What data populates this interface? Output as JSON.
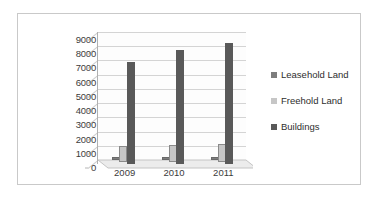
{
  "chart_data": {
    "type": "bar",
    "title": "",
    "subtitle": "",
    "xlabel": "",
    "ylabel": "",
    "categories": [
      "2009",
      "2010",
      "2011"
    ],
    "series": [
      {
        "name": "Leasehold Land",
        "values": [
          200,
          200,
          200
        ],
        "color": "#7d7d7d"
      },
      {
        "name": "Freehold Land",
        "values": [
          1100,
          1200,
          1250
        ],
        "color": "#c6c6c6"
      },
      {
        "name": "Buildings",
        "values": [
          7200,
          8050,
          8500
        ],
        "color": "#595959"
      }
    ],
    "ylim": [
      0,
      9000
    ],
    "yticks": [
      0,
      1000,
      2000,
      3000,
      4000,
      5000,
      6000,
      7000,
      8000,
      9000
    ],
    "ytick_labels": [
      "0",
      "1000",
      "2000",
      "3000",
      "4000",
      "5000",
      "6000",
      "7000",
      "8000",
      "9000"
    ],
    "grid": true,
    "legend_position": "right",
    "style": "3d-clustered-column"
  },
  "legend": {
    "items": [
      {
        "label": "Leasehold Land",
        "color": "#7d7d7d"
      },
      {
        "label": "Freehold Land",
        "color": "#c6c6c6"
      },
      {
        "label": "Buildings",
        "color": "#595959"
      }
    ]
  },
  "axes": {
    "y_tick_labels": [
      "9000",
      "8000",
      "7000",
      "6000",
      "5000",
      "4000",
      "3000",
      "2000",
      "1000",
      "0"
    ],
    "x_tick_labels": [
      "2009",
      "2010",
      "2011"
    ]
  },
  "colors": {
    "frame_border": "#c9c9c9",
    "gridline": "#d4d4d4",
    "axis_line": "#b0b0b0",
    "tick_text": "#3b3b3b",
    "legend_text": "#2e2e2e",
    "background": "#ffffff",
    "floor": "#ededed"
  }
}
